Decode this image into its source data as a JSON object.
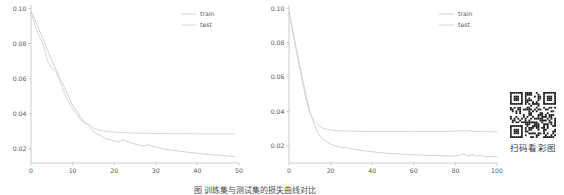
{
  "figure": {
    "caption": "图   训练集与测试集的损失曲线对比",
    "qr": {
      "caption": "扫码看彩图",
      "icon": "qr-code-icon"
    }
  },
  "chart_data": [
    {
      "type": "line",
      "title": "",
      "xlabel": "",
      "ylabel": "",
      "xlim": [
        0,
        50
      ],
      "ylim": [
        0.012,
        0.102
      ],
      "xticks": [
        0,
        10,
        20,
        30,
        40,
        50
      ],
      "yticks": [
        0.02,
        0.04,
        0.06,
        0.08,
        0.1
      ],
      "ytick_labels": [
        "0.02",
        "0.04",
        "0.06",
        "0.08",
        "0.10"
      ],
      "xtick_labels": [
        "0",
        "10",
        "20",
        "30",
        "40",
        "50"
      ],
      "grid": false,
      "legend_position": "upper right",
      "legend": [
        "train",
        "test"
      ],
      "colors": {
        "train": "#c9cdd6",
        "test": "#d6d2d0"
      },
      "x": [
        0,
        1,
        2,
        3,
        4,
        5,
        6,
        7,
        8,
        9,
        10,
        11,
        12,
        13,
        14,
        15,
        16,
        17,
        18,
        19,
        20,
        21,
        22,
        23,
        24,
        25,
        26,
        27,
        28,
        29,
        30,
        31,
        32,
        33,
        34,
        35,
        36,
        37,
        38,
        39,
        40,
        41,
        42,
        43,
        44,
        45,
        46,
        47,
        48,
        49
      ],
      "series": [
        {
          "name": "train",
          "values": [
            0.0985,
            0.0935,
            0.0878,
            0.082,
            0.0762,
            0.0705,
            0.065,
            0.06,
            0.0553,
            0.0498,
            0.045,
            0.0415,
            0.0378,
            0.035,
            0.033,
            0.03,
            0.0283,
            0.0272,
            0.0258,
            0.0252,
            0.0246,
            0.024,
            0.0252,
            0.0244,
            0.0236,
            0.0228,
            0.0222,
            0.0216,
            0.0225,
            0.0218,
            0.021,
            0.0204,
            0.02,
            0.0196,
            0.0192,
            0.019,
            0.0186,
            0.0184,
            0.018,
            0.0178,
            0.0175,
            0.0172,
            0.017,
            0.0168,
            0.0166,
            0.0165,
            0.0163,
            0.0161,
            0.0159,
            0.0158
          ]
        },
        {
          "name": "test",
          "values": [
            0.0982,
            0.09,
            0.084,
            0.079,
            0.07,
            0.066,
            0.064,
            0.058,
            0.052,
            0.047,
            0.0428,
            0.04,
            0.0362,
            0.0345,
            0.034,
            0.032,
            0.031,
            0.0303,
            0.03,
            0.0298,
            0.0296,
            0.0294,
            0.0293,
            0.0292,
            0.0291,
            0.029,
            0.029,
            0.0289,
            0.0289,
            0.0288,
            0.0288,
            0.0288,
            0.0288,
            0.0287,
            0.0287,
            0.0287,
            0.0287,
            0.0287,
            0.0287,
            0.0287,
            0.0286,
            0.0286,
            0.0286,
            0.0286,
            0.0286,
            0.0286,
            0.0286,
            0.0286,
            0.0286,
            0.0286
          ]
        }
      ]
    },
    {
      "type": "line",
      "title": "",
      "xlabel": "",
      "ylabel": "",
      "xlim": [
        0,
        100
      ],
      "ylim": [
        0.01,
        0.102
      ],
      "xticks": [
        0,
        20,
        40,
        60,
        80,
        100
      ],
      "yticks": [
        0.02,
        0.04,
        0.06,
        0.08,
        0.1
      ],
      "ytick_labels": [
        "0.02",
        "0.04",
        "0.06",
        "0.08",
        "0.10"
      ],
      "xtick_labels": [
        "0",
        "20",
        "40",
        "60",
        "80",
        "100"
      ],
      "grid": false,
      "legend_position": "upper right",
      "legend": [
        "train",
        "test"
      ],
      "colors": {
        "train": "#c9cdd6",
        "test": "#d6d2d0"
      },
      "x": [
        0,
        2,
        4,
        6,
        8,
        10,
        12,
        14,
        16,
        18,
        20,
        22,
        24,
        26,
        28,
        30,
        32,
        34,
        36,
        38,
        40,
        42,
        44,
        46,
        48,
        50,
        52,
        54,
        56,
        58,
        60,
        62,
        64,
        66,
        68,
        70,
        72,
        74,
        76,
        78,
        80,
        82,
        84,
        86,
        88,
        90,
        92,
        94,
        96,
        98,
        100
      ],
      "series": [
        {
          "name": "train",
          "values": [
            0.098,
            0.086,
            0.074,
            0.062,
            0.0505,
            0.04,
            0.033,
            0.027,
            0.024,
            0.0225,
            0.021,
            0.02,
            0.0196,
            0.0188,
            0.019,
            0.0182,
            0.018,
            0.0175,
            0.0172,
            0.0168,
            0.0166,
            0.0163,
            0.016,
            0.0158,
            0.0156,
            0.0155,
            0.0153,
            0.0152,
            0.015,
            0.0149,
            0.0148,
            0.0147,
            0.0146,
            0.0145,
            0.0144,
            0.0143,
            0.0143,
            0.0142,
            0.0142,
            0.0141,
            0.0141,
            0.0146,
            0.0152,
            0.014,
            0.0148,
            0.014,
            0.0144,
            0.0138,
            0.0137,
            0.0137,
            0.0137
          ]
        },
        {
          "name": "test",
          "values": [
            0.0978,
            0.085,
            0.072,
            0.06,
            0.048,
            0.039,
            0.0345,
            0.032,
            0.0305,
            0.0298,
            0.0292,
            0.029,
            0.0288,
            0.0287,
            0.0286,
            0.0285,
            0.0285,
            0.0284,
            0.0284,
            0.0284,
            0.0283,
            0.0283,
            0.0283,
            0.0283,
            0.0283,
            0.0283,
            0.0283,
            0.0283,
            0.0283,
            0.0282,
            0.0283,
            0.0283,
            0.0283,
            0.0283,
            0.0283,
            0.0283,
            0.0283,
            0.0283,
            0.0284,
            0.0285,
            0.0286,
            0.0288,
            0.0289,
            0.0287,
            0.0285,
            0.0284,
            0.0283,
            0.0283,
            0.0282,
            0.0282,
            0.0282
          ]
        }
      ]
    }
  ]
}
